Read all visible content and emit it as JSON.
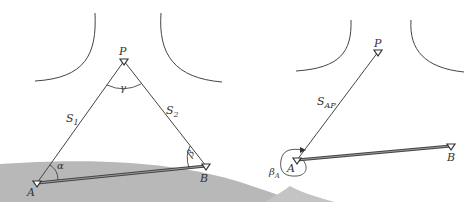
{
  "colors": {
    "ink": "#444444",
    "ground": "#b8b8b8",
    "baseline": "#555555",
    "background": "#ffffff"
  },
  "left_figure": {
    "points": {
      "P": {
        "label": "P",
        "x": 124,
        "y": 61
      },
      "A": {
        "label": "A",
        "x": 37,
        "y": 183
      },
      "B": {
        "label": "B",
        "x": 206,
        "y": 166
      }
    },
    "sides": {
      "s1": {
        "label": "S",
        "sub": "1"
      },
      "s2": {
        "label": "S",
        "sub": "2"
      }
    },
    "angles": {
      "gamma": "γ",
      "alpha": "α",
      "beta": "β"
    }
  },
  "right_figure": {
    "points": {
      "P": {
        "label": "P",
        "x": 378,
        "y": 52
      },
      "A": {
        "label": "A",
        "x": 297,
        "y": 160
      },
      "B": {
        "label": "B",
        "x": 451,
        "y": 146
      }
    },
    "sides": {
      "sap": {
        "label": "S",
        "sub": "AP"
      }
    },
    "angles": {
      "betaA": {
        "label": "β",
        "sub": "A"
      }
    }
  }
}
